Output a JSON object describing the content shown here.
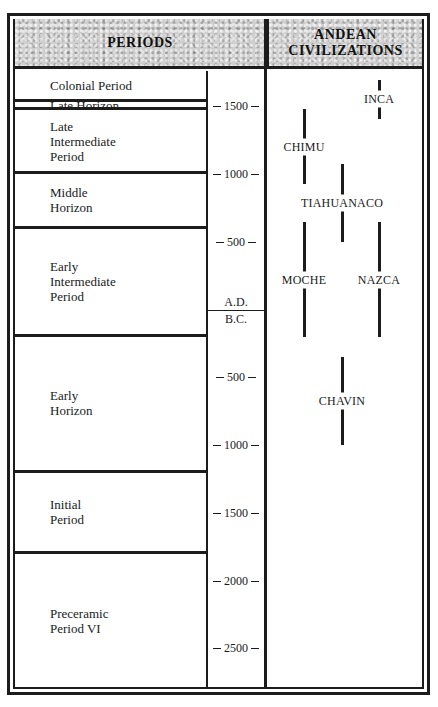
{
  "header": {
    "periods_title": "PERIODS",
    "civilizations_title": "ANDEAN\nCIVILIZATIONS"
  },
  "periods": [
    {
      "label": "Colonial Period",
      "start": 1532,
      "end": 1650
    },
    {
      "label": "Late Horizon",
      "start": 1476,
      "end": 1532
    },
    {
      "label": "Late\nIntermediate\nPeriod",
      "start": 1000,
      "end": 1476
    },
    {
      "label": "Middle\nHorizon",
      "start": 600,
      "end": 1000
    },
    {
      "label": "Early\nIntermediate\nPeriod",
      "start": -200,
      "end": 600
    },
    {
      "label": "Early\nHorizon",
      "start": -1200,
      "end": -200
    },
    {
      "label": "Initial\nPeriod",
      "start": -1800,
      "end": -1200
    },
    {
      "label": "Preceramic\nPeriod VI",
      "start": -2800,
      "end": -1800
    }
  ],
  "scale": {
    "ticks": [
      {
        "year": 1500,
        "label": "1500"
      },
      {
        "year": 1000,
        "label": "1000"
      },
      {
        "year": 500,
        "label": "500"
      },
      {
        "year": -500,
        "label": "500"
      },
      {
        "year": -1000,
        "label": "1000"
      },
      {
        "year": -1500,
        "label": "1500"
      },
      {
        "year": -2000,
        "label": "2000"
      },
      {
        "year": -2500,
        "label": "2500"
      }
    ],
    "ad_label": "A.D.",
    "bc_label": "B.C."
  },
  "chart_data": {
    "type": "timeline",
    "axis": {
      "unit": "year",
      "range": [
        -2800,
        1650
      ],
      "divider": "A.D. / B.C.",
      "ticks": [
        1500,
        1000,
        500,
        -500,
        -1000,
        -1500,
        -2000,
        -2500
      ]
    },
    "civilizations": [
      {
        "name": "INCA",
        "start": 1410,
        "end": 1700,
        "column": 3
      },
      {
        "name": "CHIMU",
        "start": 930,
        "end": 1480,
        "column": 1
      },
      {
        "name": "TIAHUANACO",
        "start": 500,
        "end": 1075,
        "column": 2
      },
      {
        "name": "MOCHE",
        "start": -200,
        "end": 650,
        "column": 1
      },
      {
        "name": "NAZCA",
        "start": -200,
        "end": 650,
        "column": 3
      },
      {
        "name": "CHAVIN",
        "start": -1000,
        "end": -350,
        "column": 2
      }
    ]
  }
}
